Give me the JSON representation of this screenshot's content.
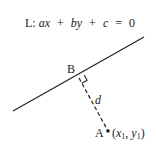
{
  "diagram": {
    "equation": {
      "prefix": "L: ",
      "terms": [
        "ax",
        "+",
        "by",
        "+",
        "c",
        "=",
        "0"
      ],
      "full_text": "L: ax + by + c = 0"
    },
    "line_L": {
      "x1": 13,
      "y1": 111,
      "x2": 144,
      "y2": 37,
      "color": "#222222"
    },
    "point_B": {
      "label": "B",
      "x": 79,
      "y": 78
    },
    "point_A": {
      "label": "A",
      "coords_label": "(x₁, y₁)",
      "x_var": "x",
      "y_var": "y",
      "subscript": "1",
      "x": 108,
      "y": 131
    },
    "distance": {
      "label": "d",
      "style": "dashed"
    },
    "right_angle_marker": true
  }
}
